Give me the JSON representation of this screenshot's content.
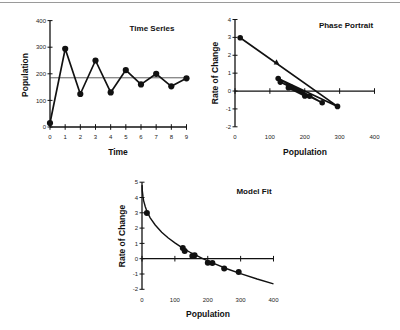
{
  "chart_data": [
    {
      "type": "line",
      "title": "Time Series",
      "xlabel": "Time",
      "ylabel": "Population",
      "x": [
        0,
        1,
        2,
        3,
        4,
        5,
        6,
        7,
        8,
        9
      ],
      "series": [
        {
          "name": "Population",
          "values": [
            15,
            294,
            124,
            250,
            130,
            214,
            160,
            200,
            153,
            183
          ],
          "markers": true
        }
      ],
      "reference_line": {
        "y": 185
      },
      "xlim": [
        0,
        9
      ],
      "ylim": [
        0,
        400
      ],
      "xticks": [
        0,
        1,
        2,
        3,
        4,
        5,
        6,
        7,
        8,
        9
      ],
      "yticks": [
        0,
        100,
        200,
        300,
        400
      ],
      "grid": false,
      "legend": "none"
    },
    {
      "type": "line",
      "title": "Phase Portrait",
      "xlabel": "Population",
      "ylabel": "Rate of Change",
      "points": [
        [
          15,
          2.98
        ],
        [
          294,
          -0.86
        ],
        [
          124,
          0.7
        ],
        [
          250,
          -0.65
        ],
        [
          130,
          0.5
        ],
        [
          214,
          -0.29
        ],
        [
          160,
          0.22
        ],
        [
          200,
          -0.27
        ],
        [
          153,
          0.18
        ]
      ],
      "connected": true,
      "arrow_marker": {
        "x": 119,
        "y": 1.6
      },
      "xlim": [
        0,
        400
      ],
      "ylim": [
        -2,
        4
      ],
      "xticks": [
        0,
        100,
        200,
        300,
        400
      ],
      "yticks": [
        -2,
        -1,
        0,
        1,
        2,
        3,
        4
      ],
      "grid": false,
      "legend": "none"
    },
    {
      "type": "scatter",
      "title": "Model Fit",
      "xlabel": "Population",
      "ylabel": "Rate of Change",
      "points": [
        [
          15,
          2.98
        ],
        [
          294,
          -0.86
        ],
        [
          124,
          0.7
        ],
        [
          250,
          -0.65
        ],
        [
          130,
          0.5
        ],
        [
          214,
          -0.29
        ],
        [
          160,
          0.22
        ],
        [
          200,
          -0.27
        ],
        [
          153,
          0.18
        ]
      ],
      "fit_curve": [
        [
          0.2,
          4.81
        ],
        [
          1,
          4.45
        ],
        [
          3,
          4.05
        ],
        [
          5,
          3.8
        ],
        [
          10,
          3.39
        ],
        [
          15,
          3.1
        ],
        [
          25,
          2.67
        ],
        [
          40,
          2.2
        ],
        [
          60,
          1.73
        ],
        [
          80,
          1.35
        ],
        [
          100,
          1.03
        ],
        [
          125,
          0.68
        ],
        [
          150,
          0.375
        ],
        [
          185,
          0
        ],
        [
          220,
          -0.33
        ],
        [
          260,
          -0.67
        ],
        [
          300,
          -0.98
        ],
        [
          350,
          -1.33
        ],
        [
          400,
          -1.64
        ]
      ],
      "xlim": [
        0,
        400
      ],
      "ylim": [
        -2,
        5
      ],
      "xticks": [
        0,
        100,
        200,
        300,
        400
      ],
      "yticks": [
        -2,
        -1,
        0,
        1,
        2,
        3,
        4,
        5
      ],
      "grid": false,
      "legend": "none"
    }
  ]
}
